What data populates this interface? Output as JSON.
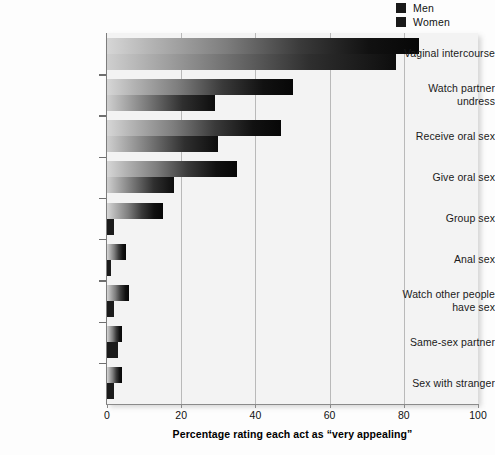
{
  "chart_data": {
    "type": "bar",
    "orientation": "horizontal",
    "title": "",
    "xlabel": "Percentage rating each act as “very appealing”",
    "ylabel": "",
    "xlim": [
      0,
      100
    ],
    "xticks": [
      0,
      20,
      40,
      60,
      80,
      100
    ],
    "xticklabels": [
      "0",
      "20",
      "40",
      "60",
      "80",
      "100"
    ],
    "grid": "vertical",
    "legend_position": "top-right",
    "categories": [
      "Vaginal intercourse",
      "Watch partner undress",
      "Receive oral sex",
      "Give oral sex",
      "Group sex",
      "Anal sex",
      "Watch other people have sex",
      "Same-sex partner",
      "Sex with stranger"
    ],
    "series": [
      {
        "name": "Men",
        "color": "#141414",
        "values": [
          84,
          50,
          47,
          35,
          15,
          5,
          6,
          4,
          4
        ]
      },
      {
        "name": "Women",
        "color": "#141414",
        "values": [
          78,
          29,
          30,
          18,
          2,
          1,
          2,
          3,
          2
        ]
      }
    ]
  },
  "legend": {
    "items": [
      {
        "label": "Men",
        "swatch": "#1a1a1a"
      },
      {
        "label": "Women",
        "swatch": "#1a1a1a"
      }
    ]
  },
  "axis": {
    "x_title": "Percentage rating each act as “very appealing”",
    "x_tick_labels": [
      "0",
      "20",
      "40",
      "60",
      "80",
      "100"
    ]
  },
  "categories_display": [
    [
      "Vaginal intercourse"
    ],
    [
      "Watch partner",
      "undress"
    ],
    [
      "Receive oral sex"
    ],
    [
      "Give oral sex"
    ],
    [
      "Group sex"
    ],
    [
      "Anal sex"
    ],
    [
      "Watch other people",
      "have sex"
    ],
    [
      "Same-sex partner"
    ],
    [
      "Sex with stranger"
    ]
  ]
}
